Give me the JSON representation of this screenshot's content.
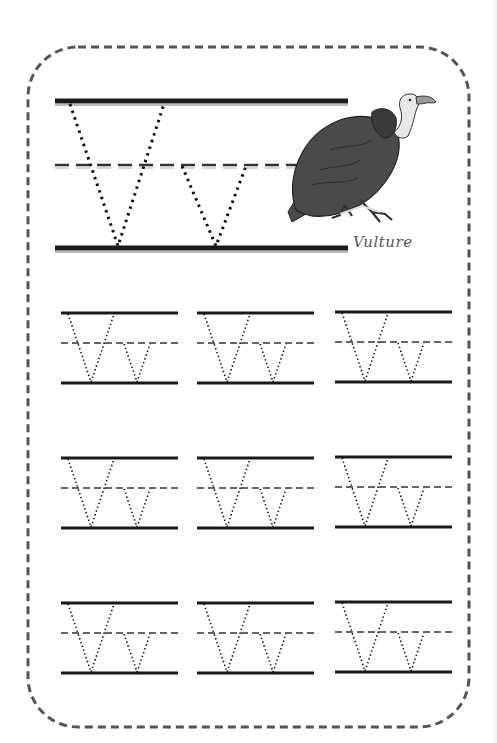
{
  "worksheet": {
    "letter_upper": "V",
    "letter_lower": "v",
    "animal_label": "Vulture",
    "animal_icon": "vulture-icon",
    "practice_rows": 3,
    "practice_columns": 3,
    "colors": {
      "border": "#555555",
      "lines": "#1a1a1a",
      "trace_dots": "#111111",
      "vulture_body": "#4a4a4a",
      "vulture_head": "#e8e8e8"
    }
  }
}
